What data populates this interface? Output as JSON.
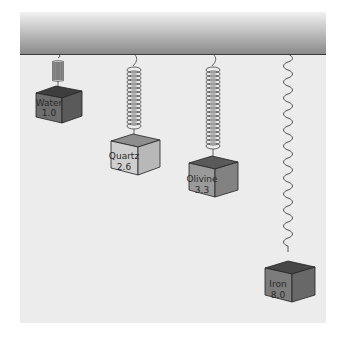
{
  "diagram": {
    "ceiling_color": "#8a8a8a",
    "background_color": "#ececec",
    "items": [
      {
        "name": "Water",
        "value": "1.0",
        "spring": "short coil",
        "box_color_front": "#6e6e6e",
        "box_color_side": "#5a5a5a",
        "box_color_top": "#3e3e3e"
      },
      {
        "name": "Quartz",
        "value": "2.6",
        "spring": "long coil",
        "box_color_front": "#cfcfcf",
        "box_color_side": "#b8b8b8",
        "box_color_top": "#8e8e8e"
      },
      {
        "name": "Olivine",
        "value": "3.3",
        "spring": "long coil",
        "box_color_front": "#9a9a9a",
        "box_color_side": "#828282",
        "box_color_top": "#5a5a5a"
      },
      {
        "name": "Iron",
        "value": "8.0",
        "spring": "stretched wave",
        "box_color_front": "#7c7c7c",
        "box_color_side": "#686868",
        "box_color_top": "#474747"
      }
    ]
  }
}
